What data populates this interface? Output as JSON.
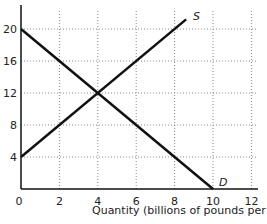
{
  "chart_data": {
    "type": "line",
    "title": "",
    "xlabel": "Quantity (billions of pounds per year)",
    "ylabel": "",
    "xlim": [
      0,
      12.5
    ],
    "ylim": [
      0,
      22
    ],
    "grid": true,
    "x_ticks": [
      "0",
      "2",
      "4",
      "6",
      "8",
      "10",
      "12"
    ],
    "y_ticks": [
      "4",
      "8",
      "12",
      "16",
      "20"
    ],
    "series": [
      {
        "name": "S",
        "label": "S",
        "x": [
          0,
          8.6
        ],
        "y": [
          4,
          21.2
        ]
      },
      {
        "name": "D",
        "label": "D",
        "x": [
          0,
          10
        ],
        "y": [
          20,
          0
        ]
      }
    ],
    "equilibrium": {
      "x": 4,
      "y": 12
    }
  }
}
